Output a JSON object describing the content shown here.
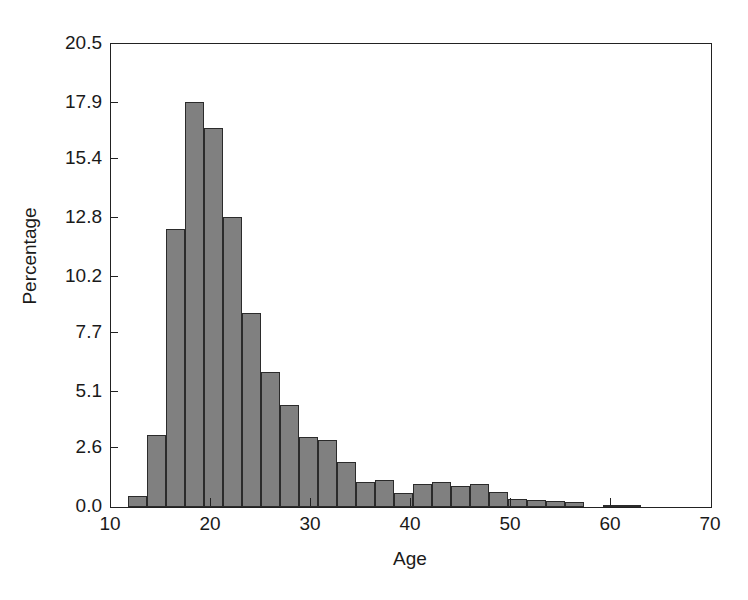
{
  "chart_data": {
    "type": "bar",
    "title": "",
    "subtitle": "",
    "xlabel": "Age",
    "ylabel": "Percentage",
    "xlim": [
      10,
      70
    ],
    "ylim": [
      0,
      20.5
    ],
    "grid": false,
    "legend": null,
    "bar_color": "#808080",
    "bar_edge_color": "#2b2b2b",
    "axis_color": "#222222",
    "background": "#ffffff",
    "xticks": [
      10,
      20,
      30,
      40,
      50,
      60,
      70
    ],
    "xtick_labels": [
      "10",
      "20",
      "30",
      "40",
      "50",
      "60",
      "70"
    ],
    "yticks": [
      0.0,
      2.6,
      5.1,
      7.7,
      10.2,
      12.8,
      15.4,
      17.9,
      20.5
    ],
    "ytick_labels": [
      "0.0",
      "2.6",
      "5.1",
      "7.7",
      "10.2",
      "12.8",
      "15.4",
      "17.9",
      "20.5"
    ],
    "bin_width": 1.9,
    "bin_starts": [
      11.7,
      13.6,
      15.5,
      17.4,
      19.3,
      21.2,
      23.1,
      25.0,
      26.9,
      28.8,
      30.7,
      32.6,
      34.5,
      36.4,
      38.3,
      40.2,
      42.1,
      44.0,
      45.9,
      47.8,
      49.7,
      51.6,
      53.5,
      55.4,
      57.3,
      59.2,
      61.1,
      63.0
    ],
    "categories": [
      "11.7-13.6",
      "13.6-15.5",
      "15.5-17.4",
      "17.4-19.3",
      "19.3-21.2",
      "21.2-23.1",
      "23.1-25.0",
      "25.0-26.9",
      "26.9-28.8",
      "28.8-30.7",
      "30.7-32.6",
      "32.6-34.5",
      "34.5-36.4",
      "36.4-38.3",
      "38.3-40.2",
      "40.2-42.1",
      "42.1-44.0",
      "44.0-45.9",
      "45.9-47.8",
      "47.8-49.7",
      "49.7-51.6",
      "51.6-53.5",
      "53.5-55.4",
      "55.4-57.3",
      "57.3-59.2",
      "59.2-61.1",
      "61.1-63.0",
      "63.0-64.9"
    ],
    "values": [
      0.5,
      3.2,
      12.3,
      17.95,
      16.8,
      12.85,
      8.6,
      6.0,
      4.5,
      3.1,
      2.95,
      2.0,
      1.1,
      1.2,
      0.6,
      1.0,
      1.1,
      0.95,
      1.0,
      0.65,
      0.35,
      0.3,
      0.25,
      0.2,
      0.0,
      0.1,
      0.1,
      0.0
    ],
    "series": [
      {
        "name": "Percentage",
        "values": [
          0.5,
          3.2,
          12.3,
          17.95,
          16.8,
          12.85,
          8.6,
          6.0,
          4.5,
          3.1,
          2.95,
          2.0,
          1.1,
          1.2,
          0.6,
          1.0,
          1.1,
          0.95,
          1.0,
          0.65,
          0.35,
          0.3,
          0.25,
          0.2,
          0.0,
          0.1,
          0.1,
          0.0
        ]
      }
    ]
  }
}
